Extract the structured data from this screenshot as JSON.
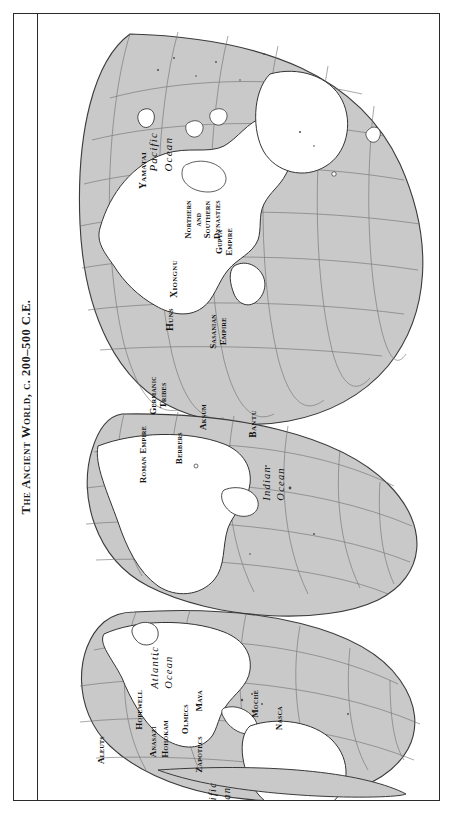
{
  "page": {
    "title": "The Ancient World, c. 200–500 C.E.",
    "frame_color": "#2b2b2b",
    "background": "#ffffff"
  },
  "map": {
    "projection": "interrupted Goode homolosine",
    "ocean_fill": "#c9c9c9",
    "land_fill": "#ffffff",
    "coast_color": "#333333",
    "graticule_color": "#6b6b6b",
    "rotation_deg": -90,
    "oceans": [
      {
        "id": "pacific-west",
        "name": "Pacific Ocean",
        "lines": [
          "Pacific",
          "Ocean"
        ]
      },
      {
        "id": "indian",
        "name": "Indian Ocean",
        "lines": [
          "Indian",
          "Ocean"
        ]
      },
      {
        "id": "atlantic",
        "name": "Atlantic Ocean",
        "lines": [
          "Atlantic",
          "Ocean"
        ]
      },
      {
        "id": "pacific-east",
        "name": "Pacific Ocean",
        "lines": [
          "Pacific",
          "Ocean"
        ]
      }
    ],
    "regions": [
      {
        "id": "yamatai",
        "label": "Yamatai",
        "lines": [
          "Yamatai"
        ]
      },
      {
        "id": "xiongnu",
        "label": "Xiongnu",
        "lines": [
          "Xiongnu"
        ]
      },
      {
        "id": "northern-and-southern-dynasties",
        "label": "Northern and Southern Dynasties",
        "lines": [
          "Northern",
          "and",
          "Southern",
          "Dynasties"
        ]
      },
      {
        "id": "gupta-empire",
        "label": "Gupta Empire",
        "lines": [
          "Gupta",
          "Empire"
        ]
      },
      {
        "id": "sasanian-empire",
        "label": "Sasanian Empire",
        "lines": [
          "Sasanian",
          "Empire"
        ]
      },
      {
        "id": "huns",
        "label": "Huns",
        "lines": [
          "Huns"
        ]
      },
      {
        "id": "germanic-tribes",
        "label": "Germanic Tribes",
        "lines": [
          "Germanic",
          "Tribes"
        ]
      },
      {
        "id": "roman-empire",
        "label": "Roman Empire",
        "lines": [
          "Roman Empire"
        ]
      },
      {
        "id": "berbers",
        "label": "Berbers",
        "lines": [
          "Berbers"
        ]
      },
      {
        "id": "aksum",
        "label": "Aksum",
        "lines": [
          "Aksum"
        ]
      },
      {
        "id": "bantu",
        "label": "Bantu",
        "lines": [
          "Bantu"
        ]
      },
      {
        "id": "aleuts",
        "label": "Aleuts",
        "lines": [
          "Aleuts"
        ]
      },
      {
        "id": "hopewell",
        "label": "Hopewell",
        "lines": [
          "Hopewell"
        ]
      },
      {
        "id": "anasazi",
        "label": "Anasazi",
        "lines": [
          "Anasazi"
        ]
      },
      {
        "id": "hohokam",
        "label": "Hohokam",
        "lines": [
          "Hohokam"
        ]
      },
      {
        "id": "olmecs",
        "label": "Olmecs",
        "lines": [
          "Olmecs"
        ]
      },
      {
        "id": "maya",
        "label": "Maya",
        "lines": [
          "Maya"
        ]
      },
      {
        "id": "zapotecs",
        "label": "Zapotecs",
        "lines": [
          "Zapotecs"
        ]
      },
      {
        "id": "moche",
        "label": "Moche",
        "lines": [
          "Moche"
        ]
      },
      {
        "id": "nasca",
        "label": "Nasca",
        "lines": [
          "Nasca"
        ]
      }
    ]
  }
}
